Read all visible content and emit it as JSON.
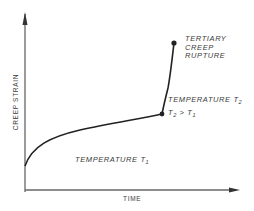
{
  "diagram": {
    "axes": {
      "y_label": "CREEP STRAIN",
      "x_label": "TIME"
    },
    "annotations": {
      "rupture": {
        "line1": "TERTIARY",
        "line2": "CREEP",
        "line3": "RUPTURE"
      },
      "temperature_t2": {
        "prefix": "TEMPERATURE T",
        "subscript": "2"
      },
      "t2_gt_t1": {
        "a": "T",
        "a_sub": "2",
        "op": " > ",
        "b": "T",
        "b_sub": "1"
      },
      "temperature_t1": {
        "prefix": "TEMPERATURE T",
        "subscript": "1"
      }
    },
    "colors": {
      "axis": "#555555",
      "curve": "#222222",
      "text": "#3a3a3a"
    }
  }
}
